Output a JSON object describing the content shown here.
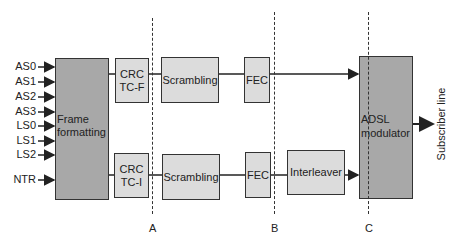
{
  "diagram": {
    "inputs": [
      "AS0",
      "AS1",
      "AS2",
      "AS3",
      "LS0",
      "LS1",
      "LS2",
      "NTR"
    ],
    "blocks": {
      "frame_formatting": "Frame formatting",
      "crc_fast_line1": "CRC",
      "crc_fast_line2": "TC-F",
      "crc_interleaved_line1": "CRC",
      "crc_interleaved_line2": "TC-I",
      "scrambling_fast": "Scrambling",
      "scrambling_interleaved": "Scrambling",
      "fec_fast": "FEC",
      "fec_interleaved": "FEC",
      "interleaver": "Interleaver",
      "adsl_modulator_line1": "ADSL",
      "adsl_modulator_line2": "modulator"
    },
    "output": "Subscriber line",
    "reference_points": [
      "A",
      "B",
      "C"
    ],
    "colors": {
      "light_block": "#dcdcdc",
      "dark_block": "#a8a8a8",
      "stroke": "#333333"
    }
  }
}
